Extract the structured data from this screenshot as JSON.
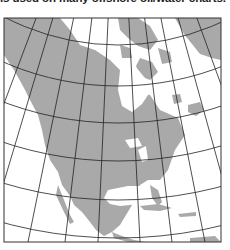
{
  "caption": "is used on many offshore oil/water charts.",
  "map": {
    "subject": "North America",
    "projection": "conic (Lambert conformal style) with graticule",
    "colors": {
      "land": "#a9a9a9",
      "water": "#ffffff",
      "graticule": "#222222",
      "frame": "#333333"
    },
    "frame": {
      "x": 4,
      "y": 18,
      "width": 217,
      "height": 224
    }
  }
}
